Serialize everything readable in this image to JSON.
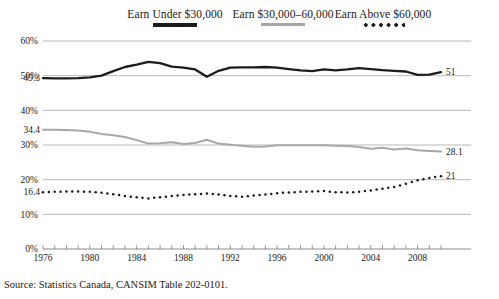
{
  "chart_data": {
    "type": "line",
    "title": "",
    "xlabel": "",
    "ylabel": "",
    "xlim": [
      1976,
      2010
    ],
    "ylim": [
      0,
      60
    ],
    "grid": true,
    "legend_position": "top",
    "y_ticks": [
      "0%",
      "10%",
      "20%",
      "30%",
      "40%",
      "50%",
      "60%"
    ],
    "y_tick_values": [
      0,
      10,
      20,
      30,
      40,
      50,
      60
    ],
    "x_ticks": [
      "1976",
      "1980",
      "1984",
      "1988",
      "1992",
      "1996",
      "2000",
      "2004",
      "2008"
    ],
    "x_tick_values": [
      1976,
      1980,
      1984,
      1988,
      1992,
      1996,
      2000,
      2004,
      2008
    ],
    "x": [
      1976,
      1977,
      1978,
      1979,
      1980,
      1981,
      1982,
      1983,
      1984,
      1985,
      1986,
      1987,
      1988,
      1989,
      1990,
      1991,
      1992,
      1993,
      1994,
      1995,
      1996,
      1997,
      1998,
      1999,
      2000,
      2001,
      2002,
      2003,
      2004,
      2005,
      2006,
      2007,
      2008,
      2009,
      2010
    ],
    "series": [
      {
        "name": "Earn Under $30,000",
        "style": "solid",
        "color": "#1c1c1c",
        "start_label": "49.3",
        "end_label": "51",
        "values": [
          49.3,
          49.2,
          49.2,
          49.3,
          49.5,
          50.0,
          51.3,
          52.5,
          53.2,
          54.0,
          53.6,
          52.6,
          52.3,
          51.8,
          49.7,
          51.4,
          52.3,
          52.4,
          52.4,
          52.5,
          52.3,
          51.9,
          51.5,
          51.3,
          51.8,
          51.5,
          51.8,
          52.2,
          51.9,
          51.6,
          51.4,
          51.2,
          50.2,
          50.3,
          51.0
        ]
      },
      {
        "name": "Earn $30,000–60,000",
        "style": "solid",
        "color": "#a8a8a8",
        "start_label": "34.4",
        "end_label": "28.1",
        "values": [
          34.4,
          34.4,
          34.3,
          34.2,
          33.8,
          33.2,
          32.8,
          32.3,
          31.4,
          30.4,
          30.5,
          30.8,
          30.3,
          30.6,
          31.5,
          30.4,
          30.1,
          29.8,
          29.5,
          29.6,
          29.9,
          29.9,
          29.9,
          29.9,
          29.9,
          29.8,
          29.7,
          29.4,
          28.9,
          29.2,
          28.7,
          29.0,
          28.5,
          28.3,
          28.1
        ]
      },
      {
        "name": "Earn Above $60,000",
        "style": "dotted",
        "color": "#1c1c1c",
        "start_label": "16.4",
        "end_label": "21",
        "values": [
          16.4,
          16.5,
          16.6,
          16.6,
          16.5,
          16.2,
          15.8,
          15.3,
          14.9,
          14.6,
          14.9,
          15.3,
          15.6,
          15.8,
          16.0,
          15.7,
          15.3,
          15.1,
          15.4,
          15.7,
          16.1,
          16.3,
          16.5,
          16.6,
          16.7,
          16.4,
          16.3,
          16.5,
          16.9,
          17.4,
          17.9,
          18.8,
          19.8,
          20.5,
          21.0
        ]
      }
    ]
  },
  "legend": {
    "items": [
      {
        "label": "Earn Under $30,000",
        "swatch": "solid-dark"
      },
      {
        "label": "Earn $30,000–60,000",
        "swatch": "solid-gray"
      },
      {
        "label": "Earn Above $60,000",
        "swatch": "dotted"
      }
    ]
  },
  "source": {
    "text": "Source: Statistics Canada, CANSIM Table 202-0101."
  }
}
